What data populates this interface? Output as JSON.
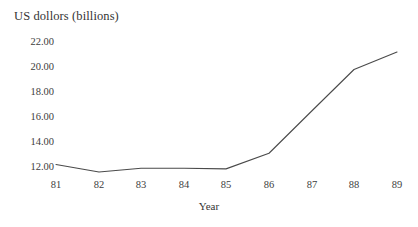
{
  "chart_data": {
    "type": "line",
    "title": "US dollors (billions)",
    "xlabel": "Year",
    "ylabel": "US dollors (billions)",
    "categories": [
      "81",
      "82",
      "83",
      "84",
      "85",
      "86",
      "87",
      "88",
      "89"
    ],
    "x": [
      81,
      82,
      83,
      84,
      85,
      86,
      87,
      88,
      89
    ],
    "values": [
      12.2,
      11.6,
      11.9,
      11.9,
      11.85,
      13.1,
      16.5,
      19.8,
      21.2
    ],
    "series": [
      {
        "name": "US dollors (billions)",
        "values": [
          12.2,
          11.6,
          11.9,
          11.9,
          11.85,
          13.1,
          16.5,
          19.8,
          21.2
        ]
      }
    ],
    "ytick_labels": [
      "22.00",
      "20.00",
      "18.00",
      "16.00",
      "14.00",
      "12.00"
    ],
    "ytick_values": [
      22.0,
      20.0,
      18.0,
      16.0,
      14.0,
      12.0
    ],
    "xtick_labels": [
      "81",
      "82",
      "83",
      "84",
      "85",
      "86",
      "87",
      "88",
      "89"
    ],
    "ylim": [
      11.0,
      22.6
    ],
    "xlim": [
      80.6,
      89.3
    ],
    "grid": false,
    "legend": false,
    "line_color": "#4a4a4a",
    "background_color": "#ffffff"
  },
  "axes": {
    "y_ticks": [
      {
        "label": "22.00",
        "value": 22.0,
        "top": 37
      },
      {
        "label": "20.00",
        "value": 20.0,
        "top": 62
      },
      {
        "label": "18.00",
        "value": 18.0,
        "top": 87
      },
      {
        "label": "16.00",
        "value": 16.0,
        "top": 112
      },
      {
        "label": "14.00",
        "value": 14.0,
        "top": 137
      },
      {
        "label": "12.00",
        "value": 12.0,
        "top": 162
      }
    ],
    "x_ticks": [
      {
        "label": "81",
        "value": 81,
        "left": 56
      },
      {
        "label": "82",
        "value": 82,
        "left": 99
      },
      {
        "label": "83",
        "value": 83,
        "left": 141
      },
      {
        "label": "84",
        "value": 84,
        "left": 184
      },
      {
        "label": "85",
        "value": 85,
        "left": 226
      },
      {
        "label": "86",
        "value": 86,
        "left": 269
      },
      {
        "label": "87",
        "value": 87,
        "left": 312
      },
      {
        "label": "88",
        "value": 88,
        "left": 354
      },
      {
        "label": "89",
        "value": 89,
        "left": 397
      }
    ]
  }
}
